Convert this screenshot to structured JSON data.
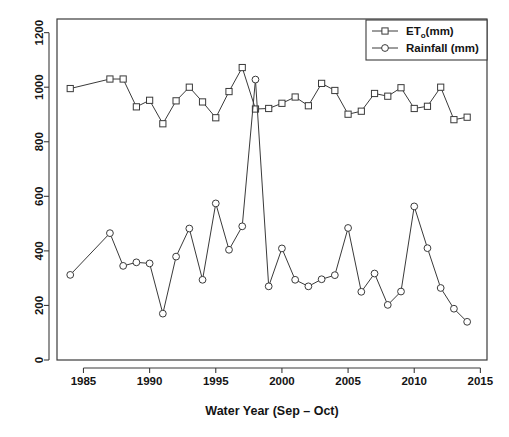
{
  "chart_data": {
    "type": "line",
    "title": "",
    "subtitle": "",
    "xlabel": "Water Year (Sep – Oct)",
    "ylabel": "",
    "xlim": [
      1983,
      2015.5
    ],
    "ylim": [
      0,
      1250
    ],
    "xticks": [
      1985,
      1990,
      1995,
      2000,
      2005,
      2010,
      2015
    ],
    "xticklabels": [
      "1985",
      "1990",
      "1995",
      "2000",
      "2005",
      "2010",
      "2015"
    ],
    "yticks": [
      0,
      200,
      400,
      600,
      800,
      1000,
      1200
    ],
    "yticklabels": [
      "0",
      "200",
      "400",
      "600",
      "800",
      "1000",
      "1200"
    ],
    "grid": false,
    "legend_position": "top-right",
    "legend": [
      {
        "label": "ET",
        "sub": "o",
        "suffix": "(mm)",
        "marker": "square",
        "name": "eto-legend-entry"
      },
      {
        "label": "Rainfall (mm)",
        "sub": "",
        "suffix": "",
        "marker": "circle",
        "name": "rainfall-legend-entry"
      }
    ],
    "series": [
      {
        "name": "ET₀(mm)",
        "marker": "square",
        "color": "#3a3a3a",
        "points": [
          {
            "x": 1984,
            "y": 995,
            "connected": false
          },
          {
            "x": 1987,
            "y": 1030,
            "connected": true
          },
          {
            "x": 1988,
            "y": 1030,
            "connected": true
          },
          {
            "x": 1989,
            "y": 928,
            "connected": true
          },
          {
            "x": 1990,
            "y": 952,
            "connected": true
          },
          {
            "x": 1991,
            "y": 866,
            "connected": true
          },
          {
            "x": 1992,
            "y": 950,
            "connected": true
          },
          {
            "x": 1993,
            "y": 1000,
            "connected": true
          },
          {
            "x": 1994,
            "y": 946,
            "connected": true
          },
          {
            "x": 1995,
            "y": 888,
            "connected": true
          },
          {
            "x": 1996,
            "y": 984,
            "connected": true
          },
          {
            "x": 1997,
            "y": 1072,
            "connected": true
          },
          {
            "x": 1998,
            "y": 920,
            "connected": true
          },
          {
            "x": 1999,
            "y": 922,
            "connected": true
          },
          {
            "x": 2000,
            "y": 941,
            "connected": true
          },
          {
            "x": 2001,
            "y": 964,
            "connected": true
          },
          {
            "x": 2002,
            "y": 932,
            "connected": true
          },
          {
            "x": 2003,
            "y": 1014,
            "connected": true
          },
          {
            "x": 2004,
            "y": 988,
            "connected": true
          },
          {
            "x": 2005,
            "y": 901,
            "connected": true
          },
          {
            "x": 2006,
            "y": 912,
            "connected": true
          },
          {
            "x": 2007,
            "y": 977,
            "connected": true
          },
          {
            "x": 2008,
            "y": 967,
            "connected": true
          },
          {
            "x": 2009,
            "y": 998,
            "connected": true
          },
          {
            "x": 2010,
            "y": 922,
            "connected": true
          },
          {
            "x": 2011,
            "y": 930,
            "connected": true
          },
          {
            "x": 2012,
            "y": 1000,
            "connected": true
          },
          {
            "x": 2013,
            "y": 881,
            "connected": true
          },
          {
            "x": 2014,
            "y": 890,
            "connected": true
          }
        ]
      },
      {
        "name": "Rainfall (mm)",
        "marker": "circle",
        "color": "#3a3a3a",
        "points": [
          {
            "x": 1984,
            "y": 312,
            "connected": false
          },
          {
            "x": 1987,
            "y": 465,
            "connected": true
          },
          {
            "x": 1988,
            "y": 345,
            "connected": true
          },
          {
            "x": 1989,
            "y": 358,
            "connected": true
          },
          {
            "x": 1990,
            "y": 354,
            "connected": true
          },
          {
            "x": 1991,
            "y": 170,
            "connected": true
          },
          {
            "x": 1992,
            "y": 379,
            "connected": true
          },
          {
            "x": 1993,
            "y": 482,
            "connected": true
          },
          {
            "x": 1994,
            "y": 294,
            "connected": true
          },
          {
            "x": 1995,
            "y": 574,
            "connected": true
          },
          {
            "x": 1996,
            "y": 404,
            "connected": true
          },
          {
            "x": 1997,
            "y": 490,
            "connected": true
          },
          {
            "x": 1998,
            "y": 1028,
            "connected": true
          },
          {
            "x": 1999,
            "y": 270,
            "connected": true
          },
          {
            "x": 2000,
            "y": 409,
            "connected": true
          },
          {
            "x": 2001,
            "y": 294,
            "connected": true
          },
          {
            "x": 2002,
            "y": 270,
            "connected": true
          },
          {
            "x": 2003,
            "y": 296,
            "connected": true
          },
          {
            "x": 2004,
            "y": 311,
            "connected": true
          },
          {
            "x": 2005,
            "y": 484,
            "connected": true
          },
          {
            "x": 2006,
            "y": 250,
            "connected": true
          },
          {
            "x": 2007,
            "y": 317,
            "connected": true
          },
          {
            "x": 2008,
            "y": 202,
            "connected": true
          },
          {
            "x": 2009,
            "y": 251,
            "connected": true
          },
          {
            "x": 2010,
            "y": 563,
            "connected": true
          },
          {
            "x": 2011,
            "y": 410,
            "connected": true
          },
          {
            "x": 2012,
            "y": 264,
            "connected": true
          },
          {
            "x": 2013,
            "y": 188,
            "connected": true
          },
          {
            "x": 2014,
            "y": 140,
            "connected": true
          }
        ]
      }
    ]
  }
}
